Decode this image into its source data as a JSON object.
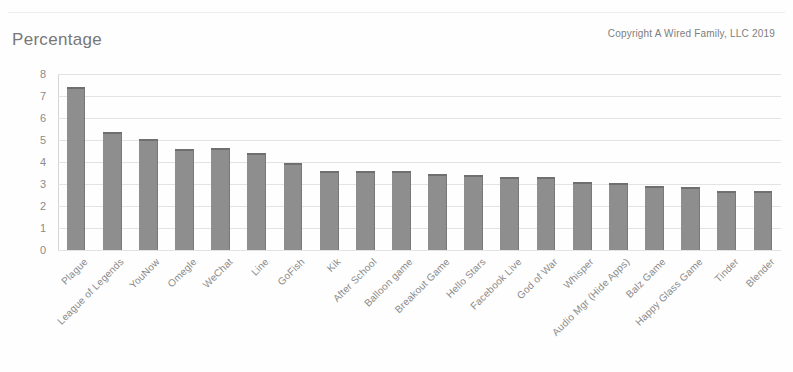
{
  "document": {
    "top_cut_title": "",
    "copyright": "Copyright A Wired Family, LLC 2019"
  },
  "chart_data": {
    "type": "bar",
    "title": "Percentage",
    "xlabel": "",
    "ylabel": "",
    "ylim": [
      0,
      8
    ],
    "yticks": [
      0,
      1,
      2,
      3,
      4,
      5,
      6,
      7,
      8
    ],
    "grid": true,
    "legend": null,
    "bar_color": "#8e8e8e",
    "bar_top_color": "#6f6f6f",
    "categories": [
      "Plague",
      "League of Legends",
      "YouNow",
      "Omegle",
      "WeChat",
      "Line",
      "GoFish",
      "Kik",
      "After School",
      "Balloon game",
      "Breakout Game",
      "Hello Stars",
      "Facebook Live",
      "God of War",
      "Whisper",
      "Audio Mgr (Hide Apps)",
      "Balz Game",
      "Happy Glass Game",
      "Tinder",
      "Blender"
    ],
    "values": [
      7.4,
      5.35,
      5.05,
      4.6,
      4.65,
      4.4,
      3.95,
      3.6,
      3.6,
      3.6,
      3.45,
      3.4,
      3.3,
      3.3,
      3.1,
      3.05,
      2.9,
      2.85,
      2.7,
      2.7
    ]
  }
}
